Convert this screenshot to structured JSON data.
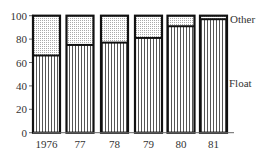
{
  "chart_data": {
    "type": "bar",
    "stacked": true,
    "title": "",
    "xlabel": "",
    "ylabel": "",
    "categories": [
      "1976",
      "77",
      "78",
      "79",
      "80",
      "81"
    ],
    "series": [
      {
        "name": "Float",
        "pattern": "vertical-stripes",
        "values": [
          66,
          75,
          77,
          81,
          91,
          97
        ]
      },
      {
        "name": "Other",
        "pattern": "dotted",
        "values": [
          34,
          25,
          23,
          19,
          9,
          3
        ]
      }
    ],
    "ylim": [
      0,
      100
    ],
    "yticks": [
      0,
      20,
      40,
      60,
      80,
      100
    ],
    "grid": false,
    "legend": {
      "position": "right-inline",
      "entries": [
        "Other",
        "Float"
      ]
    }
  },
  "colors": {
    "outline": "#111111",
    "stripe": "#555555",
    "dots": "#999999",
    "text": "#333333"
  }
}
